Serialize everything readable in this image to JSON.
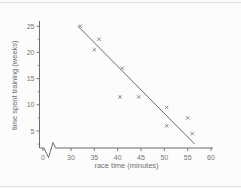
{
  "chart_data": {
    "type": "scatter",
    "title": "",
    "xlabel": "race time (minutes)",
    "ylabel": "time spent training (weeks)",
    "x_tick_labels": [
      0,
      30,
      35,
      40,
      45,
      50,
      55,
      60
    ],
    "y_tick_labels": [
      5,
      10,
      15,
      20,
      25
    ],
    "y_minor_ticks": [
      2.5,
      7.5,
      12.5,
      17.5,
      22.5
    ],
    "x_axis_break_between": [
      0,
      30
    ],
    "xlim": [
      30,
      60
    ],
    "ylim": [
      0,
      25
    ],
    "grid": false,
    "legend": false,
    "marker_style": "x",
    "points": [
      {
        "x": 32,
        "y": 25
      },
      {
        "x": 36,
        "y": 22.5
      },
      {
        "x": 35,
        "y": 20.5
      },
      {
        "x": 41,
        "y": 17
      },
      {
        "x": 40.5,
        "y": 11.5
      },
      {
        "x": 44.5,
        "y": 11.5
      },
      {
        "x": 50.5,
        "y": 9.5
      },
      {
        "x": 55,
        "y": 7.5
      },
      {
        "x": 50.5,
        "y": 6
      },
      {
        "x": 56,
        "y": 4.5
      }
    ],
    "trend_line": {
      "x_start": 31.5,
      "y_start": 25,
      "x_end": 56.5,
      "y_end": 2.5
    },
    "colors": {
      "axis": "#6b6b6b",
      "tick_text": "#757575",
      "marker": "#7d7d7d",
      "trend": "#6b6b6b",
      "page_rule": "#e2e2e2"
    }
  }
}
